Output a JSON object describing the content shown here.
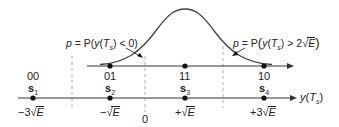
{
  "diagram": {
    "type": "constellation-with-gaussian",
    "colors": {
      "line": "#333333",
      "dashed": "#aaaaaa",
      "dot": "#111111",
      "curve": "#444444"
    },
    "top_axis": {
      "points": [
        {
          "bits": "01",
          "x": 110
        },
        {
          "bits": "11",
          "x": 185
        },
        {
          "bits": "10",
          "x": 264
        }
      ]
    },
    "bottom_axis": {
      "label_var": "y",
      "label_arg": "T",
      "label_sub": "s",
      "symbols": [
        {
          "bits": "00",
          "name": "s",
          "sub": "1",
          "value_prefix": "−3",
          "value_root": "E"
        },
        {
          "bits": "01",
          "name": "s",
          "sub": "2",
          "value_prefix": "−",
          "value_root": "E"
        },
        {
          "bits": "11",
          "name": "s",
          "sub": "3",
          "value_prefix": "+",
          "value_root": "E"
        },
        {
          "bits": "10",
          "name": "s",
          "sub": "4",
          "value_prefix": "+3",
          "value_root": "E"
        }
      ],
      "zero_label": "0"
    },
    "annotations": {
      "left": {
        "p": "p",
        "eq": " = P(",
        "y": "y",
        "T": "T",
        "s": "s",
        "cond": ") < 0)"
      },
      "right": {
        "p": "p",
        "eq": " = P",
        "y": "y",
        "T": "T",
        "s": "s",
        "cond_prefix": ") > 2",
        "root": "E"
      }
    }
  }
}
